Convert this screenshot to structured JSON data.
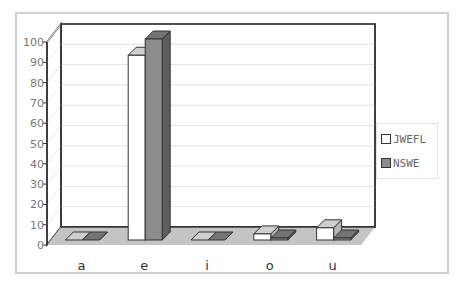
{
  "chart_data": {
    "type": "bar",
    "style": "3d-clustered-column",
    "title": "",
    "xlabel": "",
    "ylabel": "",
    "categories": [
      "a",
      "e",
      "i",
      "o",
      "u"
    ],
    "series": [
      {
        "name": "JWEFL",
        "color": "#ffffff",
        "values": [
          0,
          91,
          0,
          3,
          6
        ]
      },
      {
        "name": "NSWE",
        "color": "#8c8c8c",
        "values": [
          0,
          99,
          0,
          1,
          1
        ]
      }
    ],
    "ylim": [
      0,
      100
    ],
    "yticks": [
      0,
      10,
      20,
      30,
      40,
      50,
      60,
      70,
      80,
      90,
      100
    ],
    "grid": true,
    "legend_position": "right"
  },
  "legend": {
    "items": [
      {
        "label": "JWEFL",
        "color": "#ffffff"
      },
      {
        "label": "NSWE",
        "color": "#8c8c8c"
      }
    ]
  }
}
